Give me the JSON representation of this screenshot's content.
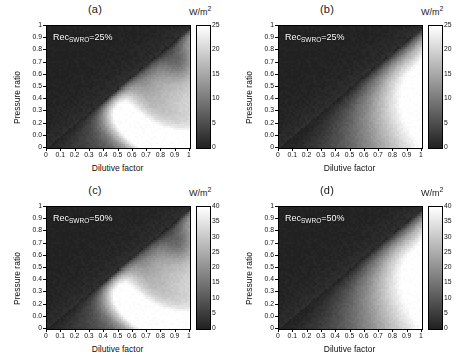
{
  "figure": {
    "unit_label_html": "W/m",
    "unit_exponent": "2",
    "xlabel": "Dilutive factor",
    "ylabel": "Pressure ratio",
    "xticks": [
      "0",
      "0.1",
      "0.2",
      "0.3",
      "0.4",
      "0.5",
      "0.6",
      "0.7",
      "0.8",
      "0.9",
      "1"
    ],
    "yticks": [
      "1",
      "0.9",
      "0.8",
      "0.7",
      "0.6",
      "0.5",
      "0.4",
      "0.3",
      "0.2",
      "0.0",
      "0"
    ]
  },
  "chart_data": [
    {
      "type": "heatmap",
      "panel": "(a)",
      "title": "(a)",
      "annotation_prefix": "Rec",
      "annotation_subscript": "SWRO",
      "annotation_suffix": "=25%",
      "recovery_percent": 25,
      "xlabel": "Dilutive factor",
      "ylabel": "Pressure ratio",
      "zlabel": "W/m2",
      "xlim": [
        0,
        1
      ],
      "ylim": [
        0,
        1
      ],
      "zlim": [
        0,
        25
      ],
      "colorbar_ticks": [
        0,
        5,
        10,
        15,
        20,
        25
      ],
      "colormap": "gray",
      "pattern": "hook",
      "peak_value": 25,
      "peak_location": [
        0.93,
        0.72
      ],
      "ridge_description": "Bright arc/hook ridge running from upper-right (0.85,0.85) curving left to (0.45,0.45) then down-right to (0.75,0.18); dark low-power triangle in upper-left above the diagonal boundary.",
      "boundary_slope": 1.0
    },
    {
      "type": "heatmap",
      "panel": "(b)",
      "title": "(b)",
      "annotation_prefix": "Rec",
      "annotation_subscript": "SWRO",
      "annotation_suffix": "=25%",
      "recovery_percent": 25,
      "xlabel": "Dilutive factor",
      "ylabel": "Pressure ratio",
      "zlabel": "W/m2",
      "xlim": [
        0,
        1
      ],
      "ylim": [
        0,
        1
      ],
      "zlim": [
        0,
        25
      ],
      "colorbar_ticks": [
        0,
        5,
        10,
        15,
        20,
        25
      ],
      "colormap": "gray",
      "pattern": "wedge",
      "peak_value": 25,
      "peak_location": [
        0.97,
        0.62
      ],
      "ridge_description": "Broad bright wedge expanding from lower-left toward the right edge, brightest near (0.95,0.6); dark triangle above the diagonal boundary.",
      "boundary_slope": 1.0
    },
    {
      "type": "heatmap",
      "panel": "(c)",
      "title": "(c)",
      "annotation_prefix": "Rec",
      "annotation_subscript": "SWRO",
      "annotation_suffix": "=50%",
      "recovery_percent": 50,
      "xlabel": "Dilutive factor",
      "ylabel": "Pressure ratio",
      "zlabel": "W/m2",
      "xlim": [
        0,
        1
      ],
      "ylim": [
        0,
        1
      ],
      "zlim": [
        0,
        40
      ],
      "colorbar_ticks": [
        0,
        5,
        10,
        15,
        20,
        25,
        30,
        35,
        40
      ],
      "colormap": "gray",
      "pattern": "hook",
      "peak_value": 40,
      "peak_location": [
        0.93,
        0.72
      ],
      "ridge_description": "Bright arc/hook ridge from upper-right curving left near (0.4,0.45) then down to (0.7,0.2); dark region upper-left.",
      "boundary_slope": 1.0
    },
    {
      "type": "heatmap",
      "panel": "(d)",
      "title": "(d)",
      "annotation_prefix": "Rec",
      "annotation_subscript": "SWRO",
      "annotation_suffix": "=50%",
      "recovery_percent": 50,
      "xlabel": "Dilutive factor",
      "ylabel": "Pressure ratio",
      "zlabel": "W/m2",
      "xlim": [
        0,
        1
      ],
      "ylim": [
        0,
        1
      ],
      "zlim": [
        0,
        40
      ],
      "colorbar_ticks": [
        0,
        5,
        10,
        15,
        20,
        25,
        30,
        35,
        40
      ],
      "colormap": "gray",
      "pattern": "wedge",
      "peak_value": 40,
      "peak_location": [
        0.97,
        0.62
      ],
      "ridge_description": "Broad bright wedge widening to the right edge, brightest near (0.95,0.62); dark triangle above diagonal.",
      "boundary_slope": 1.0
    }
  ]
}
